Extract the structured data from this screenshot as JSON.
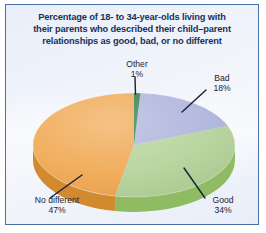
{
  "figure": {
    "title_lines": [
      "Percentage of 18- to 34-year-olds living with",
      "their parents who described their child–parent",
      "relationships as good, bad, or no different"
    ],
    "frame_color": "#4a6fa8",
    "background_color": "#eef2fa",
    "title_color": "#16325c",
    "label_color": "#1d2433",
    "leader_line_color": "#16203a"
  },
  "chart_data": {
    "type": "pie",
    "title": "Percentage of 18- to 34-year-olds living with their parents who described their child–parent relationships as good, bad, or no different",
    "xlabel": "",
    "ylabel": "",
    "unit": "percent",
    "total": 100,
    "start_angle_deg": 0,
    "direction": "clockwise",
    "three_d": true,
    "legend": "none",
    "grid": false,
    "categories": [
      "Other",
      "Bad",
      "Good",
      "No different"
    ],
    "values": [
      1,
      18,
      34,
      47
    ],
    "slices": [
      {
        "name": "Other",
        "label": "Other",
        "value": 1,
        "value_text": "1%",
        "color": "#2e7d47",
        "side_color": "#1f5c33",
        "start_deg": 0,
        "end_deg": 3.6
      },
      {
        "name": "Bad",
        "label": "Bad",
        "value": 18,
        "value_text": "18%",
        "color": "#aeb4dc",
        "side_color": "#8c92bf",
        "start_deg": 3.6,
        "end_deg": 68.4
      },
      {
        "name": "Good",
        "label": "Good",
        "value": 34,
        "value_text": "34%",
        "color": "#b5d39a",
        "side_color": "#8fbb63",
        "start_deg": 68.4,
        "end_deg": 190.8
      },
      {
        "name": "No different",
        "label": "No different",
        "value": 47,
        "value_text": "47%",
        "color": "#f0a852",
        "side_color": "#d18a2e",
        "start_deg": 190.8,
        "end_deg": 360
      }
    ]
  }
}
